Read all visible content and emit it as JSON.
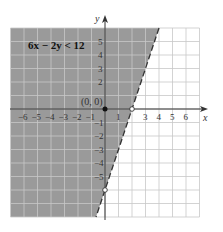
{
  "chart_data": {
    "type": "inequality-graph",
    "title": "6x − 2y < 12",
    "inequality": "6x - 2y < 12",
    "boundary_line": {
      "equation": "y = 3x - 6",
      "style": "dashed",
      "slope": 3,
      "intercept": -6
    },
    "shaded_region": "above/left of line (contains origin)",
    "xlabel": "x",
    "ylabel": "y",
    "xlim": [
      -7,
      7
    ],
    "ylim": [
      -8,
      6
    ],
    "x_ticks": [
      "-6",
      "-5",
      "-4",
      "-3",
      "-2",
      "-1",
      "1",
      "3",
      "4",
      "5",
      "6"
    ],
    "y_ticks": [
      "5",
      "4",
      "3",
      "2",
      "-1",
      "-2",
      "-3",
      "-4",
      "-5"
    ],
    "test_point": {
      "label": "(0, 0)",
      "x": 0,
      "y": 0,
      "filled": true
    },
    "intercepts": [
      {
        "x": 2,
        "y": 0,
        "filled": false
      },
      {
        "x": 0,
        "y": -6,
        "filled": false
      }
    ],
    "grid": true,
    "colors": {
      "shade": "#9a9a9a",
      "grid": "#c8c8c8",
      "axis": "#333333",
      "line": "#333333"
    }
  },
  "labels": {
    "inequality": "6x − 2y < 12",
    "origin": "(0, 0)",
    "x_axis": "x",
    "y_axis": "y"
  }
}
